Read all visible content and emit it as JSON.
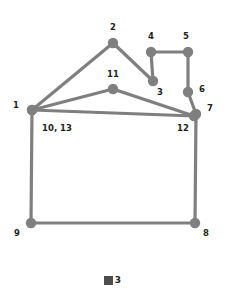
{
  "figure": {
    "background": "#ffffff",
    "edge_color": "#7f7f7f",
    "node_color": "#7f7f7f",
    "label_color": "#231f20",
    "edge_width": 3.2,
    "node_radius": 5.2
  },
  "legend": {
    "swatch_name": "legend-square-swatch",
    "swatch_color": "#4d4d4d",
    "label": "3"
  },
  "chart_data": {
    "type": "scatter",
    "title": "",
    "xlabel": "",
    "ylabel": "",
    "grid": false,
    "legend_position": "bottom-center",
    "legend_entries": [
      "3"
    ],
    "nodes": [
      {
        "id": 1,
        "label": "1",
        "x": 32,
        "y": 110,
        "label_x": 16,
        "label_y": 108,
        "label_anchor": "middle"
      },
      {
        "id": 2,
        "label": "2",
        "x": 113,
        "y": 43,
        "label_x": 113,
        "label_y": 30,
        "label_anchor": "middle"
      },
      {
        "id": 3,
        "label": "3",
        "x": 153,
        "y": 81,
        "label_x": 160,
        "label_y": 95,
        "label_anchor": "middle"
      },
      {
        "id": 4,
        "label": "4",
        "x": 151,
        "y": 52,
        "label_x": 151,
        "label_y": 39,
        "label_anchor": "middle"
      },
      {
        "id": 5,
        "label": "5",
        "x": 188,
        "y": 52,
        "label_x": 186,
        "label_y": 39,
        "label_anchor": "middle"
      },
      {
        "id": 6,
        "label": "6",
        "x": 188,
        "y": 92,
        "label_x": 199,
        "label_y": 92,
        "label_anchor": "start"
      },
      {
        "id": 7,
        "label": "7",
        "x": 196,
        "y": 114,
        "label_x": 207,
        "label_y": 111,
        "label_anchor": "start"
      },
      {
        "id": 8,
        "label": "8",
        "x": 195,
        "y": 223,
        "label_x": 206,
        "label_y": 236,
        "label_anchor": "middle"
      },
      {
        "id": 9,
        "label": "9",
        "x": 31,
        "y": 223,
        "label_x": 17,
        "label_y": 236,
        "label_anchor": "middle"
      },
      {
        "id": 11,
        "label": "11",
        "x": 113,
        "y": 89,
        "label_x": 113,
        "label_y": 77,
        "label_anchor": "middle"
      },
      {
        "id": 12,
        "label": "12",
        "x": 194,
        "y": 116,
        "label_x": 183,
        "label_y": 131,
        "label_anchor": "middle"
      },
      {
        "id": 13,
        "label": "10, 13",
        "x": 32,
        "y": 110,
        "label_x": 57,
        "label_y": 131,
        "label_anchor": "middle"
      }
    ],
    "edges": [
      {
        "from": 1,
        "to": 2,
        "name": "edge-1-2"
      },
      {
        "from": 2,
        "to": 3,
        "name": "edge-2-3"
      },
      {
        "from": 3,
        "to": 4,
        "name": "edge-3-4"
      },
      {
        "from": 4,
        "to": 5,
        "name": "edge-4-5"
      },
      {
        "from": 5,
        "to": 6,
        "name": "edge-5-6"
      },
      {
        "from": 6,
        "to": 7,
        "name": "edge-6-7"
      },
      {
        "from": 1,
        "to": 11,
        "name": "edge-1-11"
      },
      {
        "from": 11,
        "to": 12,
        "name": "edge-11-12"
      },
      {
        "from": 1,
        "to": 12,
        "name": "edge-1-12"
      },
      {
        "from": 7,
        "to": 8,
        "name": "edge-7-8"
      },
      {
        "from": 8,
        "to": 9,
        "name": "edge-8-9"
      },
      {
        "from": 9,
        "to": 1,
        "name": "edge-9-1"
      }
    ]
  }
}
